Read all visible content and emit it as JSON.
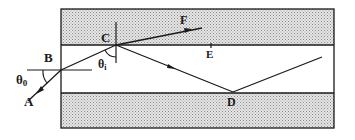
{
  "figure": {
    "type": "optical-waveguide-ray-diagram",
    "colors": {
      "ink": "#1a1a1a",
      "shade": "#bdbdbd",
      "background": "#ffffff"
    },
    "layers": [
      {
        "name": "top-cladding",
        "shaded": true
      },
      {
        "name": "core",
        "shaded": false
      },
      {
        "name": "bottom-cladding",
        "shaded": true
      }
    ],
    "labels": {
      "A": "A",
      "B": "B",
      "C": "C",
      "D": "D",
      "E": "E",
      "F": "F",
      "theta0": "θ",
      "theta0_sub": "0",
      "theta1": "θ",
      "theta1_sub": "i"
    },
    "rays": [
      {
        "name": "incident",
        "from": "A",
        "to": "B"
      },
      {
        "name": "refracted-in-core",
        "from": "B",
        "to": "C"
      },
      {
        "name": "transmitted",
        "from": "C",
        "to": "F"
      },
      {
        "name": "reflected",
        "from": "C",
        "to": "D"
      },
      {
        "name": "reflected-again",
        "from": "D",
        "to": "beyond"
      }
    ]
  }
}
